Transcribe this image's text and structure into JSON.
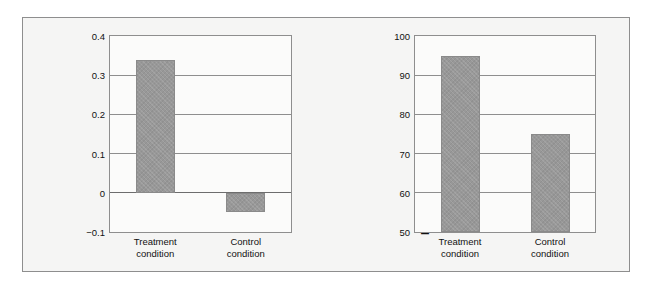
{
  "figure": {
    "background": "#ffffff",
    "panel_background": "#f5f5f4",
    "frame_color": "#8e8e8e",
    "bar_color": "#989898"
  },
  "chart_data": [
    {
      "type": "bar",
      "id": "change-in-gpa",
      "title": "",
      "xlabel": "",
      "ylabel": "Change in grade-point average",
      "categories": [
        "Treatment condition",
        "Control condition"
      ],
      "category_lines": [
        [
          "Treatment",
          "condition"
        ],
        [
          "Control",
          "condition"
        ]
      ],
      "values": [
        0.34,
        -0.05
      ],
      "ylim": [
        -0.1,
        0.4
      ],
      "yticks": [
        0.4,
        0.3,
        0.2,
        0.1,
        0,
        -0.1
      ],
      "ytick_labels": [
        "0.4",
        "0.3",
        "0.2",
        "0.1",
        "0",
        "−0.1"
      ],
      "grid": true,
      "legend": "none",
      "zero_line": 0
    },
    {
      "type": "bar",
      "id": "percentage-remaining",
      "title": "",
      "xlabel": "",
      "ylabel": "Percentage remaining in university",
      "categories": [
        "Treatment condition",
        "Control condition"
      ],
      "category_lines": [
        [
          "Treatment",
          "condition"
        ],
        [
          "Control",
          "condition"
        ]
      ],
      "values": [
        95,
        75
      ],
      "ylim": [
        50,
        100
      ],
      "yticks": [
        100,
        90,
        80,
        70,
        60,
        50
      ],
      "ytick_labels": [
        "100",
        "90",
        "80",
        "70",
        "60",
        "50"
      ],
      "grid": true,
      "legend": "none"
    }
  ]
}
